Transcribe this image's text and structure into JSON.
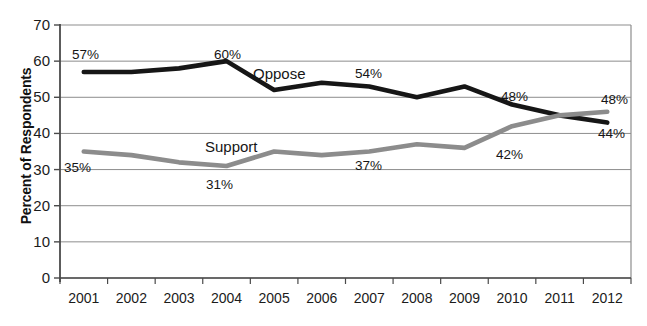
{
  "chart_data": {
    "type": "line",
    "title": "",
    "xlabel": "",
    "ylabel": "Percent of Respondents",
    "ylim": [
      0,
      70
    ],
    "ytick_step": 10,
    "yticks": [
      0,
      10,
      20,
      30,
      40,
      50,
      60,
      70
    ],
    "grid": true,
    "legend": "inline-series-labels",
    "categories": [
      "2001",
      "2002",
      "2003",
      "2004",
      "2005",
      "2006",
      "2007",
      "2008",
      "2009",
      "2010",
      "2011",
      "2012"
    ],
    "series": [
      {
        "name": "Oppose",
        "color": "#161616",
        "values": [
          57,
          57,
          58,
          60,
          52,
          54,
          53,
          50,
          53,
          48,
          45,
          43
        ]
      },
      {
        "name": "Support",
        "color": "#8c8c8c",
        "values": [
          35,
          34,
          32,
          31,
          35,
          34,
          35,
          37,
          36,
          42,
          45,
          46
        ]
      }
    ],
    "annotations": [
      {
        "text": "57%",
        "series": "Oppose",
        "category": "2001",
        "x": 72,
        "y": 47
      },
      {
        "text": "60%",
        "series": "Oppose",
        "category": "2004",
        "x": 214,
        "y": 47
      },
      {
        "text": "Oppose",
        "series": "Oppose",
        "category": "2005",
        "x": 253,
        "y": 65
      },
      {
        "text": "54%",
        "series": "Oppose",
        "category": "2007",
        "x": 355,
        "y": 66
      },
      {
        "text": "48%",
        "series": "Oppose",
        "category": "2010",
        "x": 501,
        "y": 89
      },
      {
        "text": "44%",
        "series": "Oppose",
        "category": "2012",
        "x": 598,
        "y": 126
      },
      {
        "text": "35%",
        "series": "Support",
        "category": "2001",
        "x": 64,
        "y": 160
      },
      {
        "text": "31%",
        "series": "Support",
        "category": "2004",
        "x": 206,
        "y": 177
      },
      {
        "text": "Support",
        "series": "Support",
        "category": "2004",
        "x": 205,
        "y": 138
      },
      {
        "text": "37%",
        "series": "Support",
        "category": "2007",
        "x": 355,
        "y": 158
      },
      {
        "text": "42%",
        "series": "Support",
        "category": "2010",
        "x": 496,
        "y": 147
      },
      {
        "text": "48%",
        "series": "Support",
        "category": "2012",
        "x": 601,
        "y": 92
      }
    ]
  },
  "axes": {
    "y_title": "Percent of Respondents",
    "y_tick_labels": [
      "70",
      "60",
      "50",
      "40",
      "30",
      "20",
      "10",
      "0"
    ],
    "x_tick_labels": [
      "2001",
      "2002",
      "2003",
      "2004",
      "2005",
      "2006",
      "2007",
      "2008",
      "2009",
      "2010",
      "2011",
      "2012"
    ]
  },
  "colors": {
    "oppose_line": "#161616",
    "support_line": "#8c8c8c",
    "gridline": "#8d8d8d",
    "axis": "#4a4a4a",
    "background": "#ffffff"
  }
}
